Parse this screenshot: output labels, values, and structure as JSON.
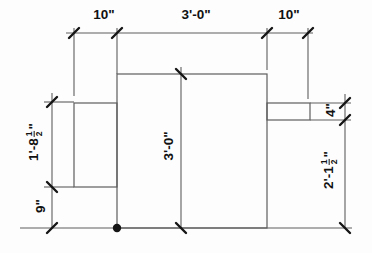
{
  "colors": {
    "bg": "#fdfdfd",
    "line": "#5e5e5e",
    "tick": "#151515",
    "text": "#111111"
  },
  "drawing": {
    "dim_top_left": "10\"",
    "dim_top_center": "3'-0\"",
    "dim_top_right": "10\"",
    "dim_left_upper": {
      "prefix": "1'-8",
      "num": "1",
      "den": "2",
      "suffix": "\""
    },
    "dim_left_lower": "9\"",
    "dim_center_height": "3'-0\"",
    "dim_right_upper": "4\"",
    "dim_right_lower": {
      "prefix": "2'-1",
      "num": "1",
      "den": "2",
      "suffix": "\""
    }
  }
}
